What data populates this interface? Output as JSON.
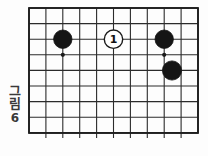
{
  "figure": {
    "caption_chars": [
      "그",
      "림"
    ],
    "caption_number": "6",
    "caption_full": "그림 6"
  },
  "board": {
    "type": "go-board-diagram",
    "left": 29,
    "top": 8,
    "right": 198,
    "bottom": 133,
    "columns": 11,
    "rows": 9,
    "col_spacing": 16.9,
    "row_spacing": 15.6,
    "line_color": "#2b2b2b",
    "border_color": "#1e1e1e",
    "background_color": "#fdfdfd",
    "stub_below_bottom": 5
  },
  "star_points": [
    {
      "name": "star-point-left",
      "col": 2,
      "row": 3,
      "cx": 62.8,
      "cy": 54.8,
      "r": 2.1,
      "color": "#1a1a1a"
    },
    {
      "name": "star-point-right",
      "col": 8,
      "row": 3,
      "cx": 164.2,
      "cy": 54.8,
      "r": 2.1,
      "color": "#1a1a1a"
    }
  ],
  "stones": [
    {
      "name": "black-stone-left",
      "color": "black",
      "fill": "#151515",
      "stroke": "#151515",
      "col": 2,
      "row": 2,
      "cx": 62.8,
      "cy": 39.2,
      "r": 9.2,
      "label": ""
    },
    {
      "name": "white-stone-move-1",
      "color": "white",
      "fill": "#ffffff",
      "stroke": "#1a1a1a",
      "col": 5,
      "row": 2,
      "cx": 113.5,
      "cy": 39.2,
      "r": 9.2,
      "label": "1"
    },
    {
      "name": "black-stone-right",
      "color": "black",
      "fill": "#151515",
      "stroke": "#151515",
      "col": 8,
      "row": 2,
      "cx": 164.2,
      "cy": 39.2,
      "r": 9.2,
      "label": ""
    },
    {
      "name": "black-stone-lower-right",
      "color": "black",
      "fill": "#151515",
      "stroke": "#151515",
      "col": 9,
      "row": 4,
      "cx": 172.0,
      "cy": 70.5,
      "r": 9.6,
      "label": ""
    }
  ],
  "chart_data": {
    "type": "table",
    "xlabel": "",
    "ylabel": "",
    "categories": [
      "col1",
      "col2",
      "col3",
      "col4",
      "col5",
      "col6",
      "col7",
      "col8",
      "col9",
      "col10",
      "col11"
    ],
    "values": [
      0,
      1,
      0,
      0,
      0,
      2,
      0,
      0,
      1,
      1,
      0
    ],
    "legend": [
      "black stone",
      "white stone (move 1)",
      "star point"
    ],
    "grid": true
  }
}
